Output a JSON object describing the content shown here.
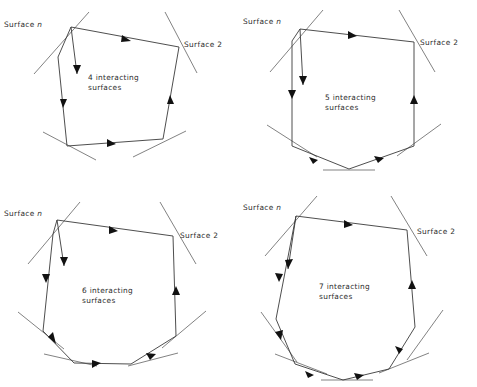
{
  "figure": {
    "type": "diagram",
    "background": "#ffffff",
    "ink_color": "#3a3a3a",
    "arrow_color": "#111111",
    "surface_tick_color": "#6b6b6b",
    "width": 477,
    "height": 387,
    "panel_count": 4
  },
  "panels": [
    {
      "id": "panel-4-surfaces",
      "position": "top-left",
      "caption_line1": "4 interacting",
      "caption_line2": "surfaces",
      "label_left": "Surface",
      "label_left_sub": "n",
      "label_right": "Surface 2",
      "surface_count": 4,
      "arrow_count": 5
    },
    {
      "id": "panel-5-surfaces",
      "position": "top-right",
      "caption_line1": "5 interacting",
      "caption_line2": "surfaces",
      "label_left": "Surface",
      "label_left_sub": "n",
      "label_right": "Surface 2",
      "surface_count": 5,
      "arrow_count": 6
    },
    {
      "id": "panel-6-surfaces",
      "position": "bottom-left",
      "caption_line1": "6 interacting",
      "caption_line2": "surfaces",
      "label_left": "Surface",
      "label_left_sub": "n",
      "label_right": "Surface 2",
      "surface_count": 6,
      "arrow_count": 7
    },
    {
      "id": "panel-7-surfaces",
      "position": "bottom-right",
      "caption_line1": "7 interacting",
      "caption_line2": "surfaces",
      "label_left": "Surface",
      "label_left_sub": "n",
      "label_right": "Surface 2",
      "surface_count": 7,
      "arrow_count": 8
    }
  ]
}
